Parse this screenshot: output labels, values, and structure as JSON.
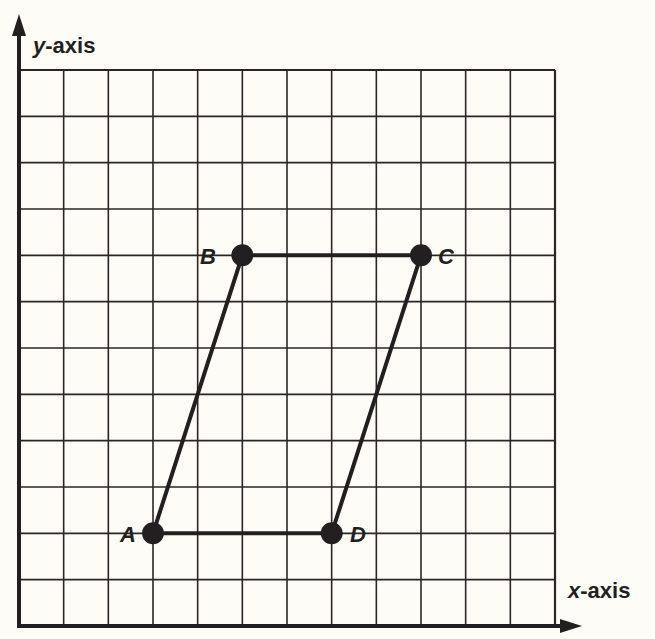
{
  "diagram": {
    "x_axis_label_var": "x",
    "x_axis_label_rest": "-axis",
    "y_axis_label_var": "y",
    "y_axis_label_rest": "-axis",
    "grid": {
      "columns": 12,
      "rows": 12
    },
    "points": [
      {
        "name": "A",
        "x": 3,
        "y": 2
      },
      {
        "name": "B",
        "x": 5,
        "y": 8
      },
      {
        "name": "C",
        "x": 9,
        "y": 8
      },
      {
        "name": "D",
        "x": 7,
        "y": 2
      }
    ],
    "colors": {
      "ink": "#231f20",
      "paper": "#fdfcf7"
    }
  }
}
